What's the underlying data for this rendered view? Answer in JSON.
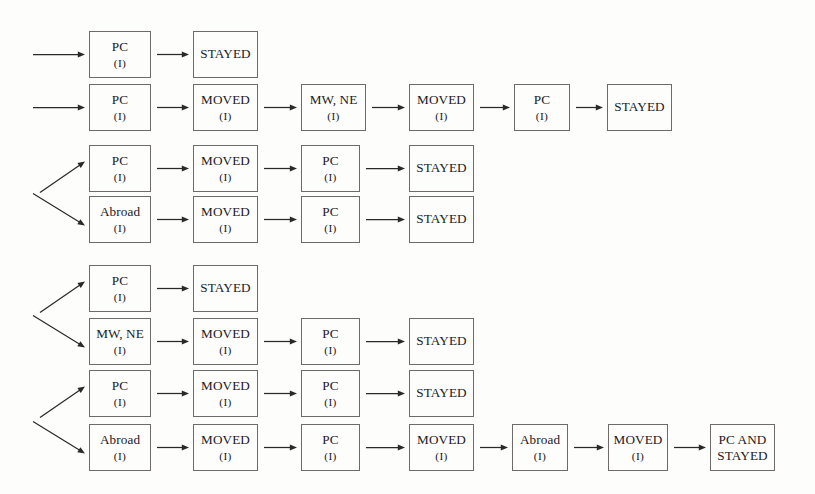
{
  "diagram": {
    "count_label": "(I)",
    "background_color": "#fdfdfc",
    "box_border_color": "#6d6a68",
    "arrow_color": "#2a2927",
    "rows": [
      {
        "id": "row-1",
        "entry_arrow": "straight",
        "nodes": [
          {
            "label": "PC",
            "sub": "(I)",
            "col": 0
          },
          {
            "label": "STAYED",
            "sub": "",
            "col": 1
          }
        ]
      },
      {
        "id": "row-2",
        "entry_arrow": "straight",
        "nodes": [
          {
            "label": "PC",
            "sub": "(I)",
            "col": 0
          },
          {
            "label": "MOVED",
            "sub": "(I)",
            "col": 1
          },
          {
            "label": "MW, NE",
            "sub": "(I)",
            "col": 2
          },
          {
            "label": "MOVED",
            "sub": "(I)",
            "col": 3
          },
          {
            "label": "PC",
            "sub": "(I)",
            "col": 4
          },
          {
            "label": "STAYED",
            "sub": "",
            "col": 5
          }
        ]
      },
      {
        "id": "row-3",
        "entry_arrow": "diagonal-up",
        "nodes": [
          {
            "label": "PC",
            "sub": "(I)",
            "col": 0
          },
          {
            "label": "MOVED",
            "sub": "(I)",
            "col": 1
          },
          {
            "label": "PC",
            "sub": "(I)",
            "col": 2
          },
          {
            "label": "STAYED",
            "sub": "",
            "col": 3
          }
        ]
      },
      {
        "id": "row-4",
        "entry_arrow": "diagonal-down",
        "nodes": [
          {
            "label": "Abroad",
            "sub": "(I)",
            "col": 0
          },
          {
            "label": "MOVED",
            "sub": "(I)",
            "col": 1
          },
          {
            "label": "PC",
            "sub": "(I)",
            "col": 2
          },
          {
            "label": "STAYED",
            "sub": "",
            "col": 3
          }
        ]
      },
      {
        "id": "row-5",
        "entry_arrow": "diagonal-up",
        "nodes": [
          {
            "label": "PC",
            "sub": "(I)",
            "col": 0
          },
          {
            "label": "STAYED",
            "sub": "",
            "col": 1
          }
        ]
      },
      {
        "id": "row-6",
        "entry_arrow": "diagonal-down",
        "nodes": [
          {
            "label": "MW, NE",
            "sub": "(I)",
            "col": 0
          },
          {
            "label": "MOVED",
            "sub": "(I)",
            "col": 1
          },
          {
            "label": "PC",
            "sub": "(I)",
            "col": 2
          },
          {
            "label": "STAYED",
            "sub": "",
            "col": 3
          }
        ]
      },
      {
        "id": "row-7",
        "entry_arrow": "diagonal-up",
        "nodes": [
          {
            "label": "PC",
            "sub": "(I)",
            "col": 0
          },
          {
            "label": "MOVED",
            "sub": "(I)",
            "col": 1
          },
          {
            "label": "PC",
            "sub": "(I)",
            "col": 2
          },
          {
            "label": "STAYED",
            "sub": "",
            "col": 3
          }
        ]
      },
      {
        "id": "row-8",
        "entry_arrow": "diagonal-down",
        "nodes": [
          {
            "label": "Abroad",
            "sub": "(I)",
            "col": 0
          },
          {
            "label": "MOVED",
            "sub": "(I)",
            "col": 1
          },
          {
            "label": "PC",
            "sub": "(I)",
            "col": 2
          },
          {
            "label": "MOVED",
            "sub": "(I)",
            "col": 3
          },
          {
            "label": "Abroad",
            "sub": "(I)",
            "col": 4
          },
          {
            "label": "MOVED",
            "sub": "(I)",
            "col": 5
          },
          {
            "label": "PC AND STAYED",
            "sub": "",
            "col": 6
          }
        ]
      }
    ]
  }
}
